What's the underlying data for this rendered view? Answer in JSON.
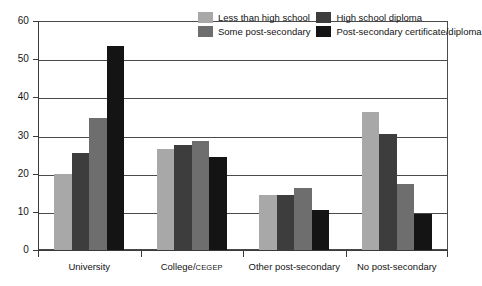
{
  "chart_data": {
    "type": "bar",
    "title": "",
    "subtitle": "",
    "xlabel": "",
    "ylabel": "",
    "ylim": [
      0,
      60
    ],
    "ytick_step": 10,
    "yticks": [
      "0",
      "10",
      "20",
      "30",
      "40",
      "50",
      "60"
    ],
    "grid": true,
    "grid_axis": "y",
    "legend_position": "top-right",
    "categories": [
      "University",
      "College/CEGEP",
      "Other post-secondary",
      "No post-secondary"
    ],
    "series": [
      {
        "name": "Less than high school",
        "color": "#a8a8a8",
        "values": [
          19.8,
          26.5,
          14.5,
          36.2
        ]
      },
      {
        "name": "High school diploma",
        "color": "#3d3d3d",
        "values": [
          25.5,
          27.5,
          14.5,
          30.3
        ]
      },
      {
        "name": "Some post-secondary",
        "color": "#6e6e6e",
        "values": [
          34.5,
          28.5,
          16.3,
          17.4
        ]
      },
      {
        "name": "Post-secondary certificate/diploma",
        "color": "#141414",
        "values": [
          53.5,
          24.5,
          10.5,
          9.5
        ]
      }
    ]
  },
  "axis": {
    "y_labels": [
      "60",
      "50",
      "40",
      "30",
      "20",
      "10",
      "0"
    ]
  },
  "x_labels": [
    {
      "main": "University",
      "suffix": ""
    },
    {
      "main": "College/",
      "suffix": "CEGEP"
    },
    {
      "main": "Other post-secondary",
      "suffix": ""
    },
    {
      "main": "No post-secondary",
      "suffix": ""
    }
  ],
  "legend": {
    "items": [
      {
        "label": "Less than high school",
        "color": "#a8a8a8"
      },
      {
        "label": "High school diploma",
        "color": "#3d3d3d"
      },
      {
        "label": "Some post-secondary",
        "color": "#6e6e6e"
      },
      {
        "label": "Post-secondary certificate/diploma",
        "color": "#141414"
      }
    ]
  },
  "colors": {
    "axis": "#3a3a3a",
    "grid": "#4a4a4a",
    "background": "#ffffff",
    "text": "#141414"
  }
}
